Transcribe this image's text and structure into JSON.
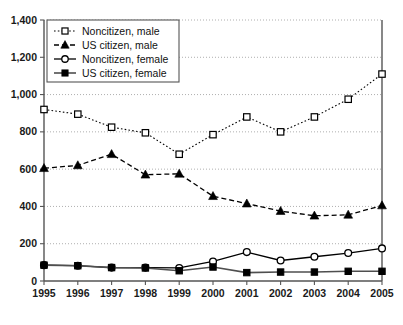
{
  "chart_data": {
    "type": "line",
    "title": "",
    "xlabel": "",
    "ylabel": "",
    "categories": [
      "1995",
      "1996",
      "1997",
      "1998",
      "1999",
      "2000",
      "2001",
      "2002",
      "2003",
      "2004",
      "2005"
    ],
    "x": [
      1995,
      1996,
      1997,
      1998,
      1999,
      2000,
      2001,
      2002,
      2003,
      2004,
      2005
    ],
    "xlim": [
      1995,
      2005
    ],
    "ylim": [
      0,
      1400
    ],
    "yticks": [
      0,
      200,
      400,
      600,
      800,
      1000,
      1200,
      1400
    ],
    "ytick_labels": [
      "0",
      "200",
      "400",
      "600",
      "800",
      "1,000",
      "1,200",
      "1,400"
    ],
    "grid": true,
    "legend_position": "upper-left",
    "series": [
      {
        "name": "Noncitizen, male",
        "marker": "open-square",
        "line": "dotted",
        "values": [
          920,
          895,
          825,
          795,
          680,
          785,
          880,
          800,
          880,
          975,
          1110
        ]
      },
      {
        "name": "US citizen, male",
        "marker": "filled-triangle",
        "line": "dashed",
        "values": [
          605,
          620,
          680,
          570,
          575,
          455,
          415,
          375,
          350,
          355,
          405
        ]
      },
      {
        "name": "Noncitizen, female",
        "marker": "open-circle",
        "line": "solid",
        "values": [
          85,
          82,
          72,
          72,
          70,
          105,
          155,
          110,
          130,
          150,
          175
        ]
      },
      {
        "name": "US citizen, female",
        "marker": "filled-square",
        "line": "solid-thick",
        "values": [
          85,
          82,
          72,
          70,
          55,
          75,
          45,
          48,
          48,
          52,
          52
        ]
      }
    ]
  },
  "legend": {
    "items": [
      {
        "label": "Noncitizen, male"
      },
      {
        "label": "US citizen, male"
      },
      {
        "label": "Noncitizen, female"
      },
      {
        "label": "US citizen, female"
      }
    ]
  },
  "colors": {
    "axis": "#555555",
    "grid": "#9a9a9a",
    "series": "#000000",
    "background": "#ffffff"
  }
}
